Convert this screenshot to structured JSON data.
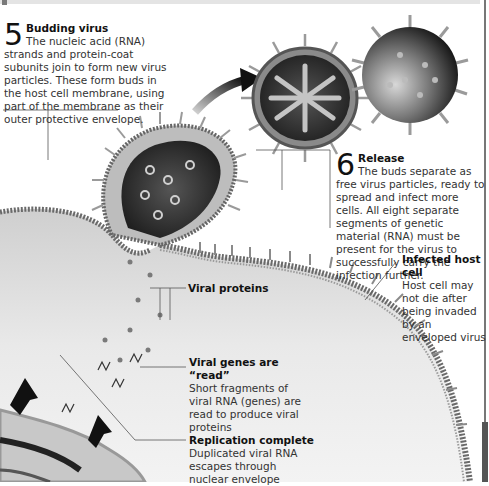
{
  "colors": {
    "background": "#ffffff",
    "cell_fill": "#d9d9d9",
    "membrane": "#6a6a6a",
    "virus_core": "#2a2a2a",
    "arrow": "#1a1a1a",
    "leader_line": "#555555"
  },
  "steps": [
    {
      "number": "5",
      "title": "Budding virus",
      "text": "The nucleic acid (RNA) strands and protein-coat subunits join to form new virus particles. These form buds in the host cell membrane, using part of the membrane as their outer protective envelope."
    },
    {
      "number": "6",
      "title": "Release",
      "text": "The buds separate as free virus particles, ready to spread and infect more cells. All eight separate segments of genetic material (RNA) must be present for the virus to successfully carry the infection further."
    }
  ],
  "labels": [
    {
      "id": "infected-host-cell",
      "title": "Infected host cell",
      "text": "Host cell may not die after being invaded by an enveloped virus"
    },
    {
      "id": "viral-proteins",
      "title": "Viral proteins",
      "text": ""
    },
    {
      "id": "viral-genes-read",
      "title": "Viral genes are “read”",
      "text": "Short fragments of viral RNA (genes) are read to produce viral proteins"
    },
    {
      "id": "replication-complete",
      "title": "Replication complete",
      "text": "Duplicated viral RNA escapes through nuclear envelope"
    }
  ],
  "icons": {
    "release-arrow": "curved-arrow-icon",
    "virus-cross-section": "virus-cross-section-icon",
    "virus-exterior": "virus-exterior-icon",
    "export-arrows": "up-arrow-icon"
  }
}
